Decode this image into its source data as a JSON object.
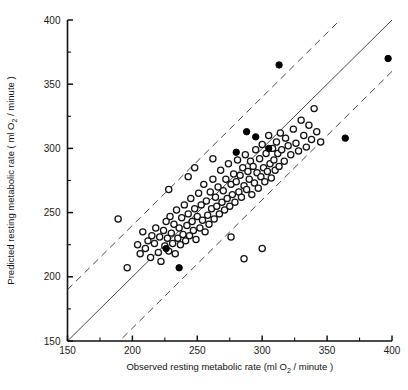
{
  "chart_data": {
    "type": "scatter",
    "title": "",
    "xlabel": "Observed resting metabolic rate  (ml O2 / minute )",
    "ylabel": "Predicted resting metabolic rate ( ml O2 / minute )",
    "xlim": [
      150,
      400
    ],
    "ylim": [
      150,
      400
    ],
    "xticks": [
      150,
      200,
      250,
      300,
      350,
      400
    ],
    "yticks": [
      150,
      200,
      250,
      300,
      350,
      400
    ],
    "xtick_labels": [
      "150",
      "200",
      "250",
      "300",
      "350",
      "400"
    ],
    "ytick_labels": [
      "150",
      "200",
      "250",
      "300",
      "350",
      "400"
    ],
    "minor_tick_interval": 25,
    "grid": false,
    "legend": "none",
    "reference_lines": [
      {
        "name": "identity",
        "style": "solid",
        "slope": 1,
        "intercept": 0
      },
      {
        "name": "upper-limit-of-agreement",
        "style": "dashed",
        "slope": 1,
        "intercept": 40
      },
      {
        "name": "lower-limit-of-agreement",
        "style": "dashed",
        "slope": 1,
        "intercept": -40
      }
    ],
    "series": [
      {
        "name": "open-circles",
        "marker": "open-circle",
        "count": 128,
        "points": [
          [
            189,
            245
          ],
          [
            196,
            207
          ],
          [
            204,
            225
          ],
          [
            206,
            218
          ],
          [
            208,
            235
          ],
          [
            210,
            222
          ],
          [
            212,
            228
          ],
          [
            214,
            215
          ],
          [
            215,
            232
          ],
          [
            217,
            226
          ],
          [
            218,
            238
          ],
          [
            220,
            219
          ],
          [
            221,
            231
          ],
          [
            222,
            212
          ],
          [
            224,
            236
          ],
          [
            225,
            224
          ],
          [
            226,
            243
          ],
          [
            227,
            230
          ],
          [
            228,
            220
          ],
          [
            229,
            247
          ],
          [
            230,
            234
          ],
          [
            231,
            226
          ],
          [
            232,
            241
          ],
          [
            233,
            218
          ],
          [
            234,
            252
          ],
          [
            235,
            230
          ],
          [
            236,
            238
          ],
          [
            237,
            225
          ],
          [
            238,
            246
          ],
          [
            239,
            233
          ],
          [
            240,
            256
          ],
          [
            241,
            228
          ],
          [
            242,
            240
          ],
          [
            243,
            249
          ],
          [
            244,
            232
          ],
          [
            245,
            261
          ],
          [
            246,
            243
          ],
          [
            247,
            236
          ],
          [
            248,
            253
          ],
          [
            249,
            229
          ],
          [
            250,
            247
          ],
          [
            251,
            265
          ],
          [
            252,
            238
          ],
          [
            253,
            256
          ],
          [
            254,
            244
          ],
          [
            255,
            272
          ],
          [
            256,
            235
          ],
          [
            257,
            259
          ],
          [
            258,
            248
          ],
          [
            259,
            241
          ],
          [
            260,
            266
          ],
          [
            261,
            253
          ],
          [
            262,
            276
          ],
          [
            263,
            245
          ],
          [
            264,
            262
          ],
          [
            265,
            255
          ],
          [
            266,
            270
          ],
          [
            267,
            249
          ],
          [
            268,
            283
          ],
          [
            269,
            258
          ],
          [
            270,
            267
          ],
          [
            271,
            252
          ],
          [
            272,
            276
          ],
          [
            273,
            261
          ],
          [
            274,
            288
          ],
          [
            275,
            255
          ],
          [
            276,
            272
          ],
          [
            277,
            264
          ],
          [
            278,
            280
          ],
          [
            279,
            258
          ],
          [
            280,
            274
          ],
          [
            281,
            291
          ],
          [
            282,
            266
          ],
          [
            283,
            279
          ],
          [
            284,
            262
          ],
          [
            285,
            285
          ],
          [
            286,
            271
          ],
          [
            287,
            295
          ],
          [
            288,
            268
          ],
          [
            289,
            282
          ],
          [
            290,
            276
          ],
          [
            291,
            290
          ],
          [
            292,
            264
          ],
          [
            293,
            286
          ],
          [
            294,
            273
          ],
          [
            295,
            299
          ],
          [
            296,
            281
          ],
          [
            297,
            269
          ],
          [
            298,
            292
          ],
          [
            299,
            278
          ],
          [
            300,
            303
          ],
          [
            301,
            285
          ],
          [
            302,
            274
          ],
          [
            303,
            296
          ],
          [
            304,
            282
          ],
          [
            305,
            310
          ],
          [
            306,
            288
          ],
          [
            307,
            277
          ],
          [
            308,
            300
          ],
          [
            309,
            291
          ],
          [
            310,
            283
          ],
          [
            311,
            305
          ],
          [
            312,
            296
          ],
          [
            313,
            286
          ],
          [
            314,
            312
          ],
          [
            315,
            299
          ],
          [
            317,
            290
          ],
          [
            318,
            308
          ],
          [
            320,
            302
          ],
          [
            322,
            295
          ],
          [
            324,
            315
          ],
          [
            326,
            304
          ],
          [
            328,
            298
          ],
          [
            330,
            322
          ],
          [
            332,
            310
          ],
          [
            334,
            301
          ],
          [
            336,
            318
          ],
          [
            338,
            307
          ],
          [
            340,
            331
          ],
          [
            342,
            313
          ],
          [
            345,
            305
          ],
          [
            228,
            268
          ],
          [
            243,
            278
          ],
          [
            248,
            285
          ],
          [
            262,
            292
          ],
          [
            276,
            231
          ],
          [
            286,
            214
          ],
          [
            300,
            222
          ]
        ]
      },
      {
        "name": "filled-circles",
        "marker": "filled-circle",
        "count": 9,
        "points": [
          [
            313,
            365
          ],
          [
            397,
            370
          ],
          [
            295,
            309
          ],
          [
            305,
            300
          ],
          [
            364,
            308
          ],
          [
            288,
            313
          ],
          [
            280,
            297
          ],
          [
            236,
            207
          ],
          [
            226,
            222
          ]
        ]
      }
    ]
  },
  "axes": {
    "x_title": "Observed  resting  metabolic  rate  (ml O",
    "x_title_sub": "2",
    "x_title_tail": " / minute )",
    "y_title": "Predicted  resting  metabolic  rate  ( ml O",
    "y_title_sub": "2",
    "y_title_tail": " / minute )"
  }
}
